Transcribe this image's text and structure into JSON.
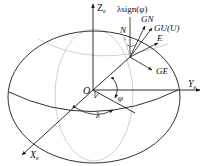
{
  "diagram": {
    "type": "ellipsoid coordinate frame",
    "colors": {
      "line": "#1a1a1a",
      "grey": "#bdbdbd"
    },
    "labels": {
      "z_axis": "Z",
      "z_sub": "e",
      "y_axis": "Y",
      "y_sub": "e",
      "x_axis": "X",
      "x_sub": "e",
      "origin": "O",
      "phi": "φ",
      "lambda": "λ",
      "lambda_sign": "λsign(φ)",
      "gn": "GN",
      "gu": "GU(U)",
      "e": "E",
      "ge": "GE",
      "n": "N"
    }
  }
}
